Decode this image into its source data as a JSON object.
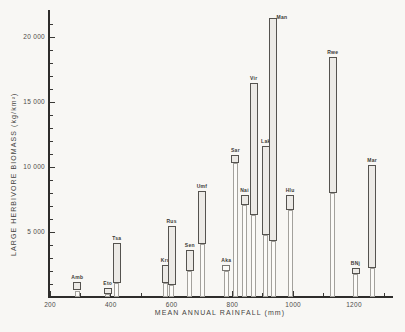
{
  "figure": {
    "background": "#f8f7f4",
    "ink_color": "#2e2d2b"
  },
  "chart_data": {
    "type": "bar",
    "title": "",
    "xlabel": "MEAN ANNUAL RAINFALL (mm)",
    "ylabel": "LARGE HERBIVORE BIOMASS (kg/km²)",
    "xlim": [
      190,
      1330
    ],
    "ylim": [
      0,
      22000
    ],
    "grid": false,
    "legend": "none",
    "x_major_ticks": [
      200,
      400,
      600,
      800,
      1000,
      1200
    ],
    "x_major_tick_labels": [
      "200",
      "400",
      "600",
      "800",
      "1000",
      "1200"
    ],
    "x_minor_step": 100,
    "y_major_ticks": [
      5000,
      10000,
      15000,
      20000
    ],
    "y_major_tick_labels": [
      "5 000",
      "10 000",
      "15 000",
      "20 000"
    ],
    "y_minor_step": 1000,
    "bar_meaning": "vertical range bars (min–max biomass) on thin stems, stippled fill",
    "sites": [
      {
        "label": "Amb",
        "rainfall_mm": 290,
        "biomass_min": 500,
        "biomass_max": 1150,
        "fill": "stipple"
      },
      {
        "label": "Eto",
        "rainfall_mm": 390,
        "biomass_min": 200,
        "biomass_max": 700,
        "fill": "stipple"
      },
      {
        "label": "Tsa",
        "rainfall_mm": 420,
        "biomass_min": 1100,
        "biomass_max": 4150,
        "fill": "stipple"
      },
      {
        "label": "Kru",
        "rainfall_mm": 580,
        "biomass_min": 1100,
        "biomass_max": 2450,
        "fill": "stipple"
      },
      {
        "label": "Rus",
        "rainfall_mm": 600,
        "biomass_min": 900,
        "biomass_max": 5500,
        "fill": "stipple"
      },
      {
        "label": "Sen",
        "rainfall_mm": 660,
        "biomass_min": 2000,
        "biomass_max": 3600,
        "fill": "stipple"
      },
      {
        "label": "Umf",
        "rainfall_mm": 700,
        "biomass_min": 4100,
        "biomass_max": 8150,
        "fill": "stipple"
      },
      {
        "label": "Aka",
        "rainfall_mm": 780,
        "biomass_min": 2000,
        "biomass_max": 2500,
        "fill": "open"
      },
      {
        "label": "Sar",
        "rainfall_mm": 810,
        "biomass_min": 10300,
        "biomass_max": 10900,
        "fill": "stipple"
      },
      {
        "label": "Nai",
        "rainfall_mm": 840,
        "biomass_min": 7100,
        "biomass_max": 7850,
        "fill": "stipple"
      },
      {
        "label": "Vir",
        "rainfall_mm": 870,
        "biomass_min": 6300,
        "biomass_max": 16450,
        "fill": "stipple"
      },
      {
        "label": "Lak",
        "rainfall_mm": 910,
        "biomass_min": 4800,
        "biomass_max": 11600,
        "fill": "stipple"
      },
      {
        "label": "Man",
        "rainfall_mm": 935,
        "biomass_min": 4300,
        "biomass_max": 21450,
        "fill": "stipple"
      },
      {
        "label": "Hlu",
        "rainfall_mm": 990,
        "biomass_min": 6700,
        "biomass_max": 7850,
        "fill": "stipple"
      },
      {
        "label": "Rwe",
        "rainfall_mm": 1130,
        "biomass_min": 8000,
        "biomass_max": 18500,
        "fill": "stipple"
      },
      {
        "label": "BNj",
        "rainfall_mm": 1205,
        "biomass_min": 1800,
        "biomass_max": 2200,
        "fill": "stipple"
      },
      {
        "label": "Mar",
        "rainfall_mm": 1260,
        "biomass_min": 2250,
        "biomass_max": 10150,
        "fill": "stipple"
      }
    ]
  }
}
